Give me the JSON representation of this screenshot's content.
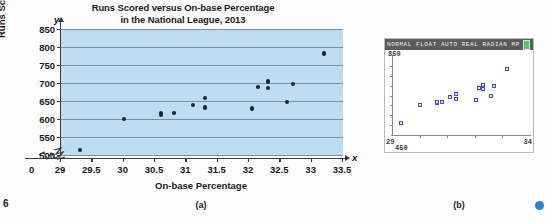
{
  "figure": {
    "page_number": "6",
    "panel_a_label": "(a)",
    "panel_b_label": "(b)",
    "corner_dot_color": "#2f7fd0"
  },
  "panel_a": {
    "title_line1": "Runs Scored versus On-base Percentage",
    "title_line2": "in the National League, 2013",
    "y_axis_title": "Runs Scored",
    "x_axis_title": "On-base Percentage",
    "y_axis_letter": "y",
    "x_axis_letter": "x",
    "origin_label": "0",
    "plot_background_color": "#bedcef",
    "gridline_color": "#6f95b4",
    "marker_color": "#16233a"
  },
  "panel_b": {
    "status_text": "NORMAL FLOAT AUTO REAL RADIAN MP",
    "battery_icon": "battery-icon",
    "y_max_label": "850",
    "y_min_label": "450",
    "x_min_label": "29",
    "x_max_label": "34",
    "marker_color": "#4a4ad0",
    "screen_background_color": "#ffffff",
    "statusbar_background_color": "#5b5b5b"
  },
  "chart_data": {
    "type": "scatter",
    "title": "Runs Scored versus On-base Percentage in the National League, 2013",
    "xlabel": "On-base Percentage",
    "ylabel": "Runs Scored",
    "xlim": [
      29,
      33.5
    ],
    "ylim": [
      500,
      850
    ],
    "xticks": [
      29,
      29.5,
      30,
      30.5,
      31,
      31.5,
      32,
      32.5,
      33,
      33.5
    ],
    "xtick_labels": [
      "29",
      "29.5",
      "30",
      "30.5",
      "31",
      "31.5",
      "32",
      "32.5",
      "33",
      "33.5"
    ],
    "yticks": [
      500,
      550,
      600,
      650,
      700,
      750,
      800,
      850
    ],
    "ytick_labels": [
      "500",
      "550",
      "600",
      "650",
      "700",
      "750",
      "800",
      "850"
    ],
    "axis_break_x": true,
    "axis_break_y": true,
    "grid": "horizontal",
    "legend": "none",
    "points": [
      {
        "x": 29.3,
        "y": 513
      },
      {
        "x": 30.0,
        "y": 601
      },
      {
        "x": 30.6,
        "y": 610
      },
      {
        "x": 30.6,
        "y": 616
      },
      {
        "x": 30.8,
        "y": 617
      },
      {
        "x": 31.1,
        "y": 640
      },
      {
        "x": 31.3,
        "y": 658
      },
      {
        "x": 31.3,
        "y": 632
      },
      {
        "x": 32.05,
        "y": 629
      },
      {
        "x": 32.15,
        "y": 688
      },
      {
        "x": 32.3,
        "y": 704
      },
      {
        "x": 32.3,
        "y": 685
      },
      {
        "x": 32.6,
        "y": 648
      },
      {
        "x": 32.7,
        "y": 698
      },
      {
        "x": 33.2,
        "y": 782
      }
    ]
  },
  "calc_chart_data": {
    "type": "scatter",
    "xlim": [
      29,
      34
    ],
    "ylim": [
      450,
      850
    ],
    "marker": "open-square",
    "points": [
      {
        "x": 29.3,
        "y": 513
      },
      {
        "x": 30.0,
        "y": 601
      },
      {
        "x": 30.6,
        "y": 610
      },
      {
        "x": 30.6,
        "y": 616
      },
      {
        "x": 30.8,
        "y": 617
      },
      {
        "x": 31.1,
        "y": 640
      },
      {
        "x": 31.3,
        "y": 658
      },
      {
        "x": 31.3,
        "y": 632
      },
      {
        "x": 32.05,
        "y": 629
      },
      {
        "x": 32.15,
        "y": 688
      },
      {
        "x": 32.3,
        "y": 704
      },
      {
        "x": 32.3,
        "y": 685
      },
      {
        "x": 32.6,
        "y": 648
      },
      {
        "x": 32.7,
        "y": 698
      },
      {
        "x": 33.2,
        "y": 782
      }
    ]
  }
}
